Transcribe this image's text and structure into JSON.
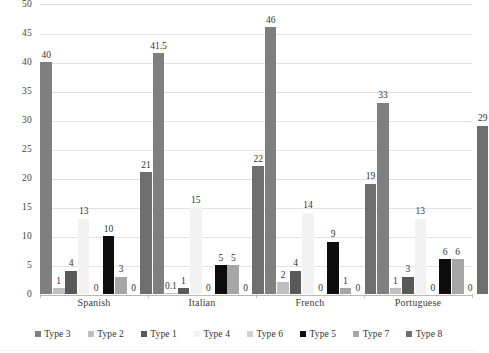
{
  "chart_data": {
    "type": "bar",
    "title": "",
    "subtitle": "",
    "xlabel": "",
    "ylabel": "",
    "ylim": [
      0,
      50
    ],
    "ytick_step": 5,
    "yticks": [
      "0",
      "5",
      "10",
      "15",
      "20",
      "25",
      "30",
      "35",
      "40",
      "45",
      "50"
    ],
    "grid": true,
    "legend_position": "bottom",
    "categories": [
      "Spanish",
      "Italian",
      "French",
      "Portuguese"
    ],
    "series": [
      {
        "name": "Type 3",
        "color": "#7f7f7f",
        "values": [
          40,
          41.5,
          46,
          33
        ],
        "labels": [
          "40",
          "41.5",
          "46",
          "33"
        ]
      },
      {
        "name": "Type 2",
        "color": "#bfbfbf",
        "values": [
          1,
          0.1,
          2,
          1
        ],
        "labels": [
          "1",
          "0.1",
          "2",
          "1"
        ]
      },
      {
        "name": "Type 1",
        "color": "#595959",
        "values": [
          4,
          1,
          4,
          3
        ],
        "labels": [
          "4",
          "1",
          "4",
          "3"
        ]
      },
      {
        "name": "Type 4",
        "color": "#f2f2f2",
        "values": [
          13,
          15,
          14,
          13
        ],
        "labels": [
          "13",
          "15",
          "14",
          "13"
        ]
      },
      {
        "name": "Type 6",
        "color": "#d0d0d0",
        "values": [
          0,
          0,
          0,
          0
        ],
        "labels": [
          "0",
          "0",
          "0",
          "0"
        ]
      },
      {
        "name": "Type 5",
        "color": "#0d0d0d",
        "values": [
          10,
          5,
          9,
          6
        ],
        "labels": [
          "10",
          "5",
          "9",
          "6"
        ]
      },
      {
        "name": "Type 7",
        "color": "#a6a6a6",
        "values": [
          3,
          5,
          1,
          6
        ],
        "labels": [
          "3",
          "5",
          "1",
          "6"
        ]
      },
      {
        "name": "Type 8",
        "color": "#6e6e6e",
        "values": [
          0,
          0,
          0,
          0
        ],
        "labels": [
          "0",
          "0",
          "0",
          "0"
        ]
      }
    ],
    "trailing_bars": [
      {
        "name": "Type 8 total",
        "color": "#6e6e6e",
        "values": [
          21,
          22,
          19,
          29
        ],
        "labels": [
          "21",
          "22",
          "19",
          "29"
        ]
      }
    ]
  }
}
